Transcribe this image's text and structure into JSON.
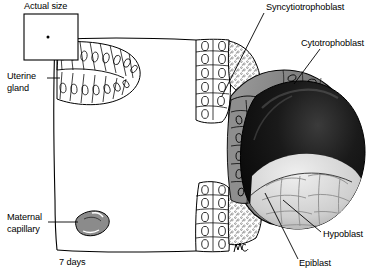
{
  "figure": {
    "title_caption": "7 days",
    "scale_box_label": "Actual size",
    "signature": "mc"
  },
  "labels": [
    {
      "id": "syncytiotrophoblast",
      "text": "Syncytiotrophoblast",
      "x": 266,
      "y": 2,
      "lines": 1
    },
    {
      "id": "cytotrophoblast",
      "text": "Cytotrophoblast",
      "x": 301,
      "y": 38,
      "lines": 1
    },
    {
      "id": "hypoblast",
      "text": "Hypoblast",
      "x": 323,
      "y": 229,
      "lines": 1
    },
    {
      "id": "epiblast",
      "text": "Epiblast",
      "x": 299,
      "y": 258,
      "lines": 1
    },
    {
      "id": "uterine-gland",
      "text": "Uterine\ngland",
      "x": 7,
      "y": 72,
      "lines": 2
    },
    {
      "id": "maternal-capillary",
      "text": "Maternal\ncapillary",
      "x": 7,
      "y": 212,
      "lines": 2
    },
    {
      "id": "actual-size",
      "text": "Actual size",
      "x": 24,
      "y": 2,
      "lines": 1
    },
    {
      "id": "seven-days",
      "text": "7 days",
      "x": 59,
      "y": 258,
      "lines": 1
    }
  ],
  "colors": {
    "ink": "#000000",
    "background": "#ffffff",
    "cytotrophoblast_fill": "#8e8e8e",
    "epithelium_fill": "#ffffff",
    "capillary_fill": "#8b8b8b",
    "cavity_dark": "#111111",
    "inner_cell_mass": "#d9d9d9",
    "stipple": "#5a5a5a"
  },
  "structures": [
    {
      "name": "endometrial-surface-epithelium",
      "description": "columnar epithelial cell layer lining the uterine cavity"
    },
    {
      "name": "uterine-gland",
      "description": "lobed gland of columnar cells opening at upper left of the endometrium"
    },
    {
      "name": "maternal-capillary",
      "description": "small shaded oval vessel in the endometrial stroma"
    },
    {
      "name": "syncytiotrophoblast",
      "description": "stippled multinucleated invasive layer above and below the embryo"
    },
    {
      "name": "cytotrophoblast",
      "description": "grey polygonal cell shell surrounding the blastocyst"
    },
    {
      "name": "blastocyst-cavity",
      "description": "dark spherical cavity of the implanting blastocyst"
    },
    {
      "name": "hypoblast",
      "description": "cell layer on the ventral surface of the embryonic disc"
    },
    {
      "name": "epiblast",
      "description": "cell layer on the dorsal surface of the embryonic disc"
    },
    {
      "name": "inner-cell-mass",
      "description": "pale cobblestone cell cluster at the lower pole of the cavity"
    },
    {
      "name": "actual-size-box",
      "description": "square reference box containing a dot showing real size of the conceptus"
    }
  ]
}
